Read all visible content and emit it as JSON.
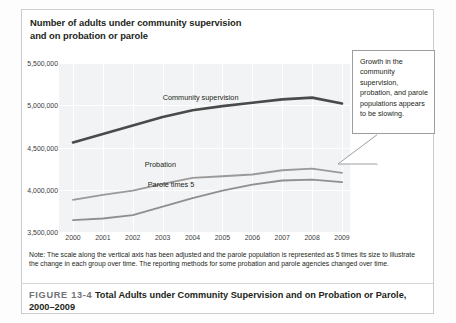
{
  "figure": {
    "chart_title_line1": "Number of adults under community supervision",
    "chart_title_line2": "and on probation or parole",
    "note": "Note: The scale along the vertical axis has been adjusted and the parole population is represented as 5 times its size to illustrate the change in each group over time. The reporting methods for some probation and parole agencies changed over time.",
    "figure_number": "FIGURE 13-4",
    "caption_text": "Total Adults under Community Supervision and on Probation or Parole, 2000–2009",
    "callout_text": "Growth in the community supervision, probation, and parole populations appears to be slowing."
  },
  "colors": {
    "plot_background": "#f2f3f4",
    "gridline": "#ffffff",
    "community_supervision": "#4a4a4a",
    "probation": "#9a9a9a",
    "parole_times_5": "#8f8f8f",
    "frame": "#c9cdd1",
    "text": "#231f20"
  },
  "chart_data": {
    "type": "line",
    "title": "Number of adults under community supervision and on probation or parole",
    "xlabel": "",
    "ylabel": "",
    "grid": true,
    "legend": "inline-labels",
    "x": [
      2000,
      2001,
      2002,
      2003,
      2004,
      2005,
      2006,
      2007,
      2008,
      2009
    ],
    "categories": [
      "2000",
      "2001",
      "2002",
      "2003",
      "2004",
      "2005",
      "2006",
      "2007",
      "2008",
      "2009"
    ],
    "ylim": [
      3500000,
      5500000
    ],
    "yticks": [
      3500000,
      4000000,
      4500000,
      5000000,
      5500000
    ],
    "ytick_labels": [
      "3,500,000",
      "4,000,000",
      "4,500,000",
      "5,000,000",
      "5,500,000"
    ],
    "series": [
      {
        "name": "Community supervision",
        "label": "Community supervision",
        "color": "#4a4a4a",
        "values": [
          4560000,
          4660000,
          4760000,
          4860000,
          4940000,
          4990000,
          5030000,
          5070000,
          5090000,
          5020000
        ]
      },
      {
        "name": "Probation",
        "label": "Probation",
        "color": "#9a9a9a",
        "values": [
          3880000,
          3940000,
          3990000,
          4070000,
          4140000,
          4160000,
          4180000,
          4230000,
          4250000,
          4200000
        ]
      },
      {
        "name": "Parole times 5",
        "label": "Parole times 5",
        "color": "#8f8f8f",
        "values": [
          3640000,
          3660000,
          3700000,
          3800000,
          3900000,
          3990000,
          4060000,
          4110000,
          4120000,
          4090000
        ]
      }
    ],
    "annotations": [
      {
        "text": "Community supervision",
        "x": 2003,
        "y": 5080000
      },
      {
        "text": "Probation",
        "x": 2002.4,
        "y": 4290000
      },
      {
        "text": "Parole times 5",
        "x": 2002.5,
        "y": 4060000
      }
    ]
  }
}
